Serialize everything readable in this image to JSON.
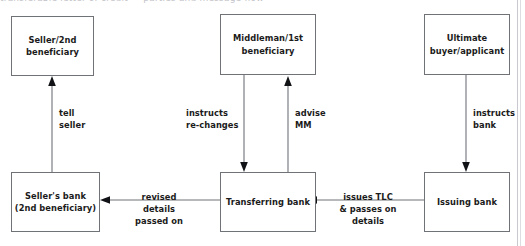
{
  "diagram": {
    "type": "flow-diagram",
    "title_sliver": "transferable letter of credit — parties and message flow",
    "nodes": [
      {
        "id": "seller",
        "label": "Seller/2nd\nbeneficiary"
      },
      {
        "id": "middleman",
        "label": "Middleman/1st\nbeneficiary"
      },
      {
        "id": "ultimate",
        "label": "Ultimate\nbuyer/applicant"
      },
      {
        "id": "sellers_bank",
        "label": "Seller's bank\n(2nd beneficiary)"
      },
      {
        "id": "transferring",
        "label": "Transferring\nbank"
      },
      {
        "id": "issuing",
        "label": "Issuing\nbank"
      }
    ],
    "edges": [
      {
        "id": "e1",
        "from": "sellers_bank",
        "to": "seller",
        "label": "tell\nseller"
      },
      {
        "id": "e2",
        "from": "middleman",
        "to": "transferring",
        "label": "instructs\nre-changes"
      },
      {
        "id": "e3",
        "from": "transferring",
        "to": "middleman",
        "label": "advise\nMM"
      },
      {
        "id": "e4",
        "from": "ultimate",
        "to": "issuing",
        "label": "instructs\nbank"
      },
      {
        "id": "e5",
        "from": "transferring",
        "to": "sellers_bank",
        "label": "revised\ndetails\npassed on"
      },
      {
        "id": "e6",
        "from": "issuing",
        "to": "transferring",
        "label": "issues TLC\n& passes on\ndetails"
      }
    ],
    "colors": {
      "box_border": "#6f7277",
      "arrow_line": "#6f7277",
      "arrow_head": "#111215",
      "text": "#1b1b1b",
      "background": "#ffffff",
      "page_edge": "#c9c9cf"
    }
  }
}
